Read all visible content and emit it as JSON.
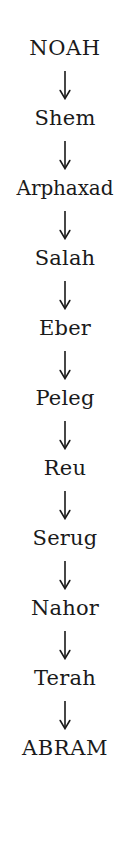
{
  "diagram": {
    "background_color": "#ffffff",
    "text_color": "#1a1a1a",
    "connector_glyph": "↓",
    "connector_name": "down-arrow",
    "orientation": "vertical-top-to-bottom",
    "node_count": 11,
    "connector_count": 10,
    "nodes": [
      {
        "label": "NOAH",
        "style": "caps",
        "order": 1
      },
      {
        "label": "Shem",
        "style": "normal",
        "order": 2
      },
      {
        "label": "Arphaxad",
        "style": "wide",
        "order": 3
      },
      {
        "label": "Salah",
        "style": "normal",
        "order": 4
      },
      {
        "label": "Eber",
        "style": "normal",
        "order": 5
      },
      {
        "label": "Peleg",
        "style": "normal",
        "order": 6
      },
      {
        "label": "Reu",
        "style": "normal",
        "order": 7
      },
      {
        "label": "Serug",
        "style": "normal",
        "order": 8
      },
      {
        "label": "Nahor",
        "style": "normal",
        "order": 9
      },
      {
        "label": "Terah",
        "style": "normal",
        "order": 10
      },
      {
        "label": "ABRAM",
        "style": "caps",
        "order": 11
      }
    ]
  }
}
